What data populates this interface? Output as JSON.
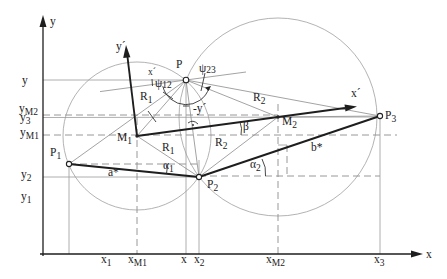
{
  "axes": {
    "x_label": "x",
    "y_label": "y"
  },
  "y_ticks": [
    {
      "main": "y",
      "sub": ""
    },
    {
      "main": "y",
      "sub": "M2"
    },
    {
      "main": "y",
      "sub": "3"
    },
    {
      "main": "y",
      "sub": "M1"
    },
    {
      "main": "y",
      "sub": "2"
    },
    {
      "main": "y",
      "sub": "1"
    }
  ],
  "x_ticks": [
    {
      "main": "x",
      "sub": "1"
    },
    {
      "main": "x",
      "sub": "M1"
    },
    {
      "main": "x",
      "sub": ""
    },
    {
      "main": "x",
      "sub": "2"
    },
    {
      "main": "x",
      "sub": "M2"
    },
    {
      "main": "x",
      "sub": "3"
    }
  ],
  "points": {
    "P": {
      "main": "P",
      "sub": ""
    },
    "P1": {
      "main": "P",
      "sub": "1"
    },
    "P2": {
      "main": "P",
      "sub": "2"
    },
    "P3": {
      "main": "P",
      "sub": "3"
    },
    "M1": {
      "main": "M",
      "sub": "1"
    },
    "M2": {
      "main": "M",
      "sub": "2"
    }
  },
  "rotated_axes": {
    "x_prime": "x´",
    "x_prime_local": "x´",
    "y_prime": "y´",
    "neg_y_prime": "-y´"
  },
  "angles": {
    "psi12": {
      "main": "ψ",
      "sub": "12"
    },
    "psi23": {
      "main": "ψ",
      "sub": "23"
    },
    "alpha1": {
      "main": "α",
      "sub": "1"
    },
    "alpha2": {
      "main": "α",
      "sub": "2"
    },
    "beta": "β"
  },
  "lengths": {
    "R1_upper": {
      "main": "R",
      "sub": "1"
    },
    "R1_lower": {
      "main": "R",
      "sub": "1"
    },
    "R2_upper": {
      "main": "R",
      "sub": "2"
    },
    "R2_lower": {
      "main": "R",
      "sub": "2"
    },
    "a_star": "a*",
    "b_star": "b*"
  }
}
